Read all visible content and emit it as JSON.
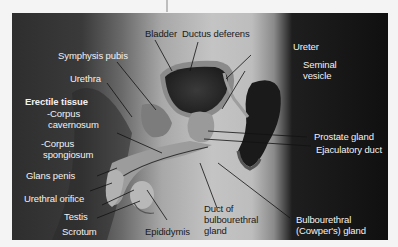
{
  "figure": {
    "colors": {
      "background": "#f4f4f4",
      "dark_panel": "#101010",
      "mid_gray": "#c4c4c4",
      "label_light": "#f2f2f2",
      "label_dark": "#1a1a1a",
      "leader_line": "#111111"
    }
  },
  "labels": {
    "bladder": "Bladder",
    "ductus_deferens": "Ductus deferens",
    "ureter": "Ureter",
    "seminal_vesicle_1": "Seminal",
    "seminal_vesicle_2": "vesicle",
    "symphysis_pubis": "Symphysis pubis",
    "urethra": "Urethra",
    "erectile_tissue": "Erectile tissue",
    "corpus_cavernosum_1": "-Corpus",
    "corpus_cavernosum_2": "cavernosum",
    "corpus_spongiosum_1": "-Corpus",
    "corpus_spongiosum_2": "spongiosum",
    "glans_penis": "Glans penis",
    "urethral_orifice": "Urethral orifice",
    "testis": "Testis",
    "scrotum": "Scrotum",
    "epididymis": "Epididymis",
    "duct_bulbourethral_1": "Duct of",
    "duct_bulbourethral_2": "bulbourethral",
    "duct_bulbourethral_3": "gland",
    "bulbourethral_gland_1": "Bulbourethral",
    "bulbourethral_gland_2": "(Cowper's) gland",
    "prostate_gland": "Prostate gland",
    "ejaculatory_duct": "Ejaculatory duct"
  }
}
